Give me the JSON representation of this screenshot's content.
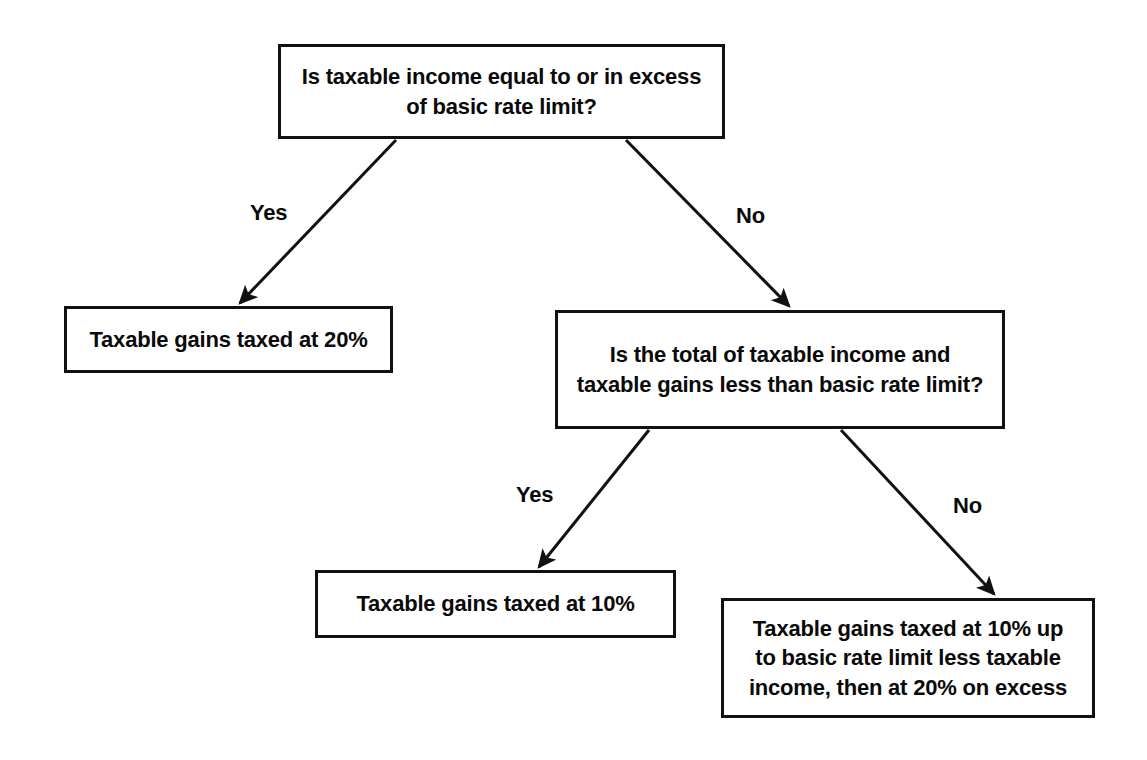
{
  "diagram": {
    "background_color": "#ffffff",
    "line_color": "#111111",
    "text_color": "#0a0a0a",
    "nodes": {
      "root": {
        "id": "root",
        "type": "decision",
        "text": "Is taxable income equal to or in excess\nof basic rate limit?"
      },
      "taxed20": {
        "id": "taxed20",
        "type": "outcome",
        "text": "Taxable gains taxed at 20%"
      },
      "decision2": {
        "id": "decision2",
        "type": "decision",
        "text": "Is the total of taxable income and\ntaxable gains less than basic rate limit?"
      },
      "taxed10": {
        "id": "taxed10",
        "type": "outcome",
        "text": "Taxable gains taxed at 10%"
      },
      "mixed": {
        "id": "mixed",
        "type": "outcome",
        "text": "Taxable gains taxed at 10% up\nto basic rate limit less taxable\nincome, then at 20% on excess"
      }
    },
    "edges": [
      {
        "id": "root-yes",
        "from": "root",
        "to": "taxed20",
        "label": "Yes"
      },
      {
        "id": "root-no",
        "from": "root",
        "to": "decision2",
        "label": "No"
      },
      {
        "id": "decision2-yes",
        "from": "decision2",
        "to": "taxed10",
        "label": "Yes"
      },
      {
        "id": "decision2-no",
        "from": "decision2",
        "to": "mixed",
        "label": "No"
      }
    ]
  }
}
